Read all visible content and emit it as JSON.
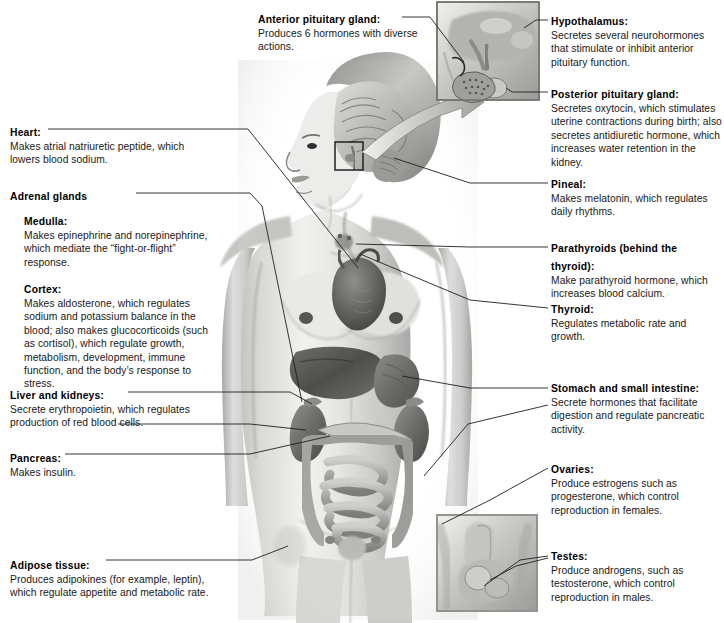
{
  "figure": {
    "kind": "anatomical-diagram",
    "background": "#ffffff",
    "art_tone": "grayscale pencil/airbrush medical illustration of a female torso with internal organs visible",
    "insets": [
      {
        "name": "pituitary-gland-inset",
        "position": "top-center-right",
        "caption_links": [
          "anterior-pituitary-gland",
          "hypothalamus",
          "posterior-pituitary-gland"
        ]
      },
      {
        "name": "male-reproductive-inset",
        "position": "bottom-center-right",
        "caption_links": [
          "testes"
        ]
      }
    ],
    "callout_box_border": "#6b6b6b",
    "leader_line_color": "#2b2b2b"
  },
  "callouts": {
    "heart": {
      "title": "Heart:",
      "body": "Makes atrial natriuretic peptide, which lowers blood sodium."
    },
    "adrenal_glands": {
      "title": "Adrenal glands"
    },
    "medulla": {
      "title": "Medulla:",
      "body": "Makes epinephrine and norepinephrine, which mediate the “fight-or-flight” response."
    },
    "cortex": {
      "title": "Cortex:",
      "body": "Makes aldosterone, which regulates sodium and potassium balance in the blood; also makes glucocorticoids (such as cortisol), which regulate growth, metabolism, development, immune function, and the body’s response to stress."
    },
    "liver_and_kidneys": {
      "title": "Liver and kidneys:",
      "body": "Secrete erythropoietin, which regulates production of red blood cells."
    },
    "pancreas": {
      "title": "Pancreas:",
      "body": "Makes insulin."
    },
    "adipose_tissue": {
      "title": "Adipose tissue:",
      "body": "Produces adipokines (for example, leptin), which regulate appetite and metabolic rate."
    },
    "anterior_pituitary_gland": {
      "title": "Anterior pituitary gland:",
      "body": "Produces 6 hormones with diverse actions."
    },
    "hypothalamus": {
      "title": "Hypothalamus:",
      "body": "Secretes several neurohormones that stimulate or inhibit anterior pituitary function."
    },
    "posterior_pituitary_gland": {
      "title": "Posterior pituitary gland:",
      "body": "Secretes oxytocin, which stimulates uterine contractions during birth; also secretes antidiuretic hormone, which increases water retention in the kidney."
    },
    "pineal": {
      "title": "Pineal:",
      "body": "Makes melatonin, which regulates daily rhythms."
    },
    "parathyroids": {
      "title": "Parathyroids",
      "title_regular": " (behind the thyroid):",
      "body": "Make parathyroid hormone, which increases blood calcium."
    },
    "thyroid": {
      "title": "Thyroid:",
      "body": "Regulates metabolic rate and growth."
    },
    "stomach_and_small_intestine": {
      "title": "Stomach and small intestine:",
      "body": "Secrete hormones that facilitate digestion and regulate pancreatic activity."
    },
    "ovaries": {
      "title": "Ovaries:",
      "body": "Produce estrogens such as progesterone, which control reproduction in females."
    },
    "testes": {
      "title": "Testes:",
      "body": "Produce androgens, such as testosterone, which control reproduction in males."
    }
  }
}
